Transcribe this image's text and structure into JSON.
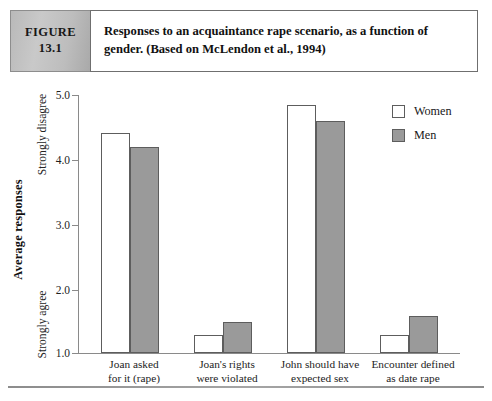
{
  "figure": {
    "badge_label": "FIGURE",
    "badge_number": "13.1",
    "caption": "Responses to an acquaintance rape scenario, as a function of gender. (Based on McLendon et al., 1994)"
  },
  "legend": {
    "position": "top-right",
    "entries": [
      {
        "label": "Women",
        "color": "#ffffff"
      },
      {
        "label": "Men",
        "color": "#9a9a9a"
      }
    ]
  },
  "axis": {
    "y_title": "Average responses",
    "anchor_high": "Strongly disagree",
    "anchor_low": "Strongly agree",
    "y_ticks": [
      "5.0",
      "4.0",
      "3.0",
      "2.0",
      "1.0"
    ]
  },
  "chart_data": {
    "type": "bar",
    "title": "Responses to an acquaintance rape scenario, as a function of gender. (Based on McLendon et al., 1994)",
    "xlabel": "",
    "ylabel": "Average responses",
    "ylim": [
      1.0,
      5.0
    ],
    "ytick_values": [
      5.0,
      4.0,
      3.0,
      2.0,
      1.0
    ],
    "grid": false,
    "legend_position": "top-right",
    "categories": [
      "Joan asked for it (rape)",
      "Joan's rights were violated",
      "John should have expected sex",
      "Encounter defined as date rape"
    ],
    "category_lines": [
      [
        "Joan asked",
        "for it (rape)"
      ],
      [
        "Joan's rights",
        "were violated"
      ],
      [
        "John should have",
        "expected sex"
      ],
      [
        "Encounter defined",
        "as date rape"
      ]
    ],
    "series": [
      {
        "name": "Women",
        "color": "#ffffff",
        "values": [
          4.41,
          1.28,
          4.85,
          1.28
        ]
      },
      {
        "name": "Men",
        "color": "#9a9a9a",
        "values": [
          4.19,
          1.48,
          4.59,
          1.58
        ]
      }
    ],
    "annotations": [
      {
        "text": "Strongly disagree",
        "at": "y-axis-top"
      },
      {
        "text": "Strongly agree",
        "at": "y-axis-bottom"
      }
    ]
  }
}
